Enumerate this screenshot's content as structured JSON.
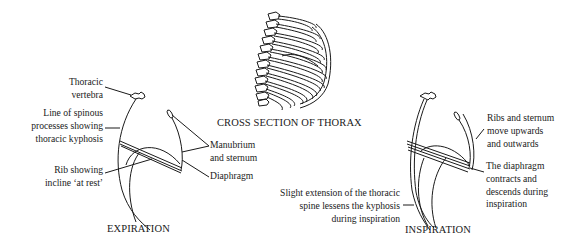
{
  "diagram": {
    "cross_section": {
      "title": "CROSS SECTION OF THORAX"
    },
    "expiration": {
      "title": "EXPIRATION",
      "labels": {
        "thoracic_vertebra": [
          "Thoracic",
          "vertebra"
        ],
        "spinous_line": [
          "Line of spinous",
          "processes showing",
          "thoracic kyphosis"
        ],
        "rib_incline": [
          "Rib showing",
          "incline ‘at rest’"
        ],
        "manubrium": [
          "Manubrium",
          "and sternum"
        ],
        "diaphragm": [
          "Diaphragm"
        ]
      }
    },
    "inspiration": {
      "title": "INSPIRATION",
      "labels": {
        "ribs_sternum": [
          "Ribs and sternum",
          "move upwards",
          "and outwards"
        ],
        "diaphragm": [
          "The diaphragm",
          "contracts and",
          "descends during",
          "inspiration"
        ],
        "spine_extension": [
          "Slight extension of the thoracic",
          "spine lessens the kyphosis",
          "during inspiration"
        ]
      }
    },
    "colors": {
      "ink": "#1a1a1a",
      "background": "#ffffff"
    }
  }
}
